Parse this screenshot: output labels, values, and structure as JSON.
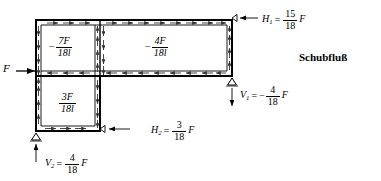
{
  "diagram": {
    "caption": "Schubfluß",
    "applied_load": {
      "symbol": "F",
      "direction": "right"
    },
    "shear_flow_labels": [
      {
        "id": "q-upper-left",
        "sign": "−",
        "numerator": "7F",
        "denominator": "18l"
      },
      {
        "id": "q-upper-right",
        "sign": "−",
        "numerator": "4F",
        "denominator": "18l"
      },
      {
        "id": "q-lower-left",
        "sign": "",
        "numerator": "3F",
        "denominator": "18l"
      }
    ],
    "reactions": [
      {
        "id": "H1",
        "symbol": "H",
        "index": "1",
        "equals": "=",
        "sign": "",
        "numerator": "15",
        "denominator": "18",
        "factor": "F"
      },
      {
        "id": "V1",
        "symbol": "V",
        "index": "1",
        "equals": "=",
        "sign": "−",
        "numerator": "4",
        "denominator": "18",
        "factor": "F"
      },
      {
        "id": "H2",
        "symbol": "H",
        "index": "2",
        "equals": "=",
        "sign": "",
        "numerator": "3",
        "denominator": "18",
        "factor": "F"
      },
      {
        "id": "V2",
        "symbol": "V",
        "index": "2",
        "equals": "=",
        "sign": "",
        "numerator": "4",
        "denominator": "18",
        "factor": "F"
      }
    ],
    "supports": [
      {
        "id": "support-right",
        "type": "roller-triangle"
      },
      {
        "id": "support-bottom-left",
        "type": "roller-triangle"
      }
    ],
    "colors": {
      "line": "#000000",
      "background": "#ffffff"
    }
  }
}
